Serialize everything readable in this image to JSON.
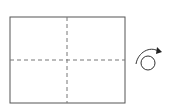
{
  "diagram": {
    "type": "origami-fold-step",
    "paper": {
      "x": 10,
      "y": 17,
      "width": 115,
      "height": 86,
      "stroke": "#555555",
      "fill": "#ffffff"
    },
    "fold_lines": [
      {
        "type": "valley",
        "orientation": "vertical",
        "x": 67
      },
      {
        "type": "valley",
        "orientation": "horizontal",
        "y": 60
      }
    ],
    "symbols": [
      {
        "icon": "turn-over-icon",
        "cx": 147,
        "cy": 62
      }
    ],
    "colors": {
      "line": "#555555",
      "dash": "#777777",
      "icon": "#333333"
    }
  }
}
